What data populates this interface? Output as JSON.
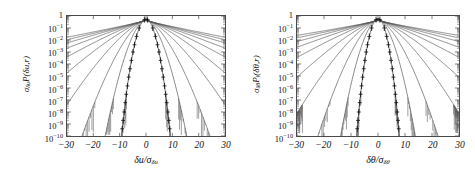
{
  "figure": {
    "background": "#ffffff",
    "axis_color": "#4a4a4a",
    "curve_color": "#555555",
    "marker_color": "#111111",
    "panels": [
      "left",
      "right"
    ]
  },
  "chart_data": [
    {
      "panel": "left",
      "type": "line",
      "title": "",
      "xlabel": "δu/σ_δu",
      "ylabel": "σ_δu P(δu,r)",
      "xlabel_parts": {
        "num": "δu",
        "den_sym": "σ",
        "den_sub": "δu"
      },
      "ylabel_parts": {
        "sigma": "σ",
        "sigma_sub": "δu",
        "p": "P",
        "p_sub": "",
        "arg": "(δu,r)"
      },
      "xlim": [
        -30,
        30
      ],
      "ylim": [
        1e-10,
        1
      ],
      "yscale": "log",
      "xticks": [
        -30,
        -20,
        -10,
        0,
        10,
        20,
        30
      ],
      "xticklabels": [
        "-30",
        "-20",
        "-10",
        "0",
        "10",
        "20",
        "30"
      ],
      "yticks": [
        1,
        0.1,
        0.01,
        0.001,
        0.0001,
        1e-05,
        1e-06,
        1e-07,
        1e-08,
        1e-09,
        1e-10
      ],
      "yticklabels": [
        "1",
        "10⁻¹",
        "10⁻²",
        "10⁻³",
        "10⁻⁴",
        "10⁻⁵",
        "10⁻⁶",
        "10⁻⁷",
        "10⁻⁸",
        "10⁻⁹",
        "10⁻¹⁰"
      ],
      "ytick_mantissa": [
        "1",
        "10",
        "10",
        "10",
        "10",
        "10",
        "10",
        "10",
        "10",
        "10",
        "10"
      ],
      "ytick_exponent": [
        "",
        "-1",
        "-2",
        "-3",
        "-4",
        "-5",
        "-6",
        "-7",
        "-8",
        "-9",
        "-10"
      ],
      "grid": false,
      "legend": "none",
      "series_count": 10,
      "marked_series_index": 0,
      "series": [
        {
          "name": "r1",
          "peak": 0.55,
          "tail_halfwidth": 6.0,
          "shape": 2.0,
          "markers": true
        },
        {
          "name": "r2",
          "peak": 0.5,
          "tail_halfwidth": 8.0,
          "shape": 1.75,
          "markers": false
        },
        {
          "name": "r3",
          "peak": 0.48,
          "tail_halfwidth": 10.0,
          "shape": 1.55,
          "markers": false
        },
        {
          "name": "r4",
          "peak": 0.46,
          "tail_halfwidth": 12.5,
          "shape": 1.4,
          "markers": false
        },
        {
          "name": "r5",
          "peak": 0.45,
          "tail_halfwidth": 15.0,
          "shape": 1.28,
          "markers": false
        },
        {
          "name": "r6",
          "peak": 0.44,
          "tail_halfwidth": 17.5,
          "shape": 1.18,
          "markers": false
        },
        {
          "name": "r7",
          "peak": 0.43,
          "tail_halfwidth": 20.0,
          "shape": 1.1,
          "markers": false
        },
        {
          "name": "r8",
          "peak": 0.42,
          "tail_halfwidth": 22.5,
          "shape": 1.04,
          "markers": false
        },
        {
          "name": "r9",
          "peak": 0.41,
          "tail_halfwidth": 25.0,
          "shape": 1.0,
          "markers": false
        },
        {
          "name": "r10",
          "peak": 0.4,
          "tail_halfwidth": 27.5,
          "shape": 0.96,
          "markers": false
        }
      ],
      "marker_symbol": "+",
      "marker_y_values": [
        0.5,
        0.1,
        0.02,
        0.004,
        0.001,
        0.0002,
        4e-05,
        8e-06,
        1.5e-06,
        3e-07,
        6e-08,
        1e-08,
        2e-09,
        4e-10
      ]
    },
    {
      "panel": "right",
      "type": "line",
      "title": "",
      "xlabel": "δθ/σ_δθ",
      "ylabel": "σ_δθ P_‖(δθ,r)",
      "xlabel_parts": {
        "num": "δθ",
        "den_sym": "σ",
        "den_sub": "δθ"
      },
      "ylabel_parts": {
        "sigma": "σ",
        "sigma_sub": "δθ",
        "p": "P",
        "p_sub": "‖",
        "arg": "(δθ,r)"
      },
      "xlim": [
        -30,
        30
      ],
      "ylim": [
        1e-10,
        1
      ],
      "yscale": "log",
      "xticks": [
        -30,
        -20,
        -10,
        0,
        10,
        20,
        30
      ],
      "xticklabels": [
        "-30",
        "-20",
        "-10",
        "0",
        "10",
        "20",
        "30"
      ],
      "yticks": [
        1,
        0.1,
        0.01,
        0.001,
        0.0001,
        1e-05,
        1e-06,
        1e-07,
        1e-08,
        1e-09,
        1e-10
      ],
      "yticklabels": [
        "1",
        "10⁻¹",
        "10⁻²",
        "10⁻³",
        "10⁻⁴",
        "10⁻⁵",
        "10⁻⁶",
        "10⁻⁷",
        "10⁻⁸",
        "10⁻⁹",
        "10⁻¹⁰"
      ],
      "ytick_mantissa": [
        "1",
        "10",
        "10",
        "10",
        "10",
        "10",
        "10",
        "10",
        "10",
        "10",
        "10"
      ],
      "ytick_exponent": [
        "",
        "-1",
        "-2",
        "-3",
        "-4",
        "-5",
        "-6",
        "-7",
        "-8",
        "-9",
        "-10"
      ],
      "grid": false,
      "legend": "none",
      "series_count": 10,
      "marked_series_index": 0,
      "series": [
        {
          "name": "r1",
          "peak": 0.58,
          "tail_halfwidth": 5.5,
          "shape": 2.1,
          "markers": true
        },
        {
          "name": "r2",
          "peak": 0.52,
          "tail_halfwidth": 7.5,
          "shape": 1.8,
          "markers": false
        },
        {
          "name": "r3",
          "peak": 0.49,
          "tail_halfwidth": 9.5,
          "shape": 1.58,
          "markers": false
        },
        {
          "name": "r4",
          "peak": 0.47,
          "tail_halfwidth": 12.0,
          "shape": 1.42,
          "markers": false
        },
        {
          "name": "r5",
          "peak": 0.46,
          "tail_halfwidth": 14.5,
          "shape": 1.3,
          "markers": false
        },
        {
          "name": "r6",
          "peak": 0.45,
          "tail_halfwidth": 17.5,
          "shape": 1.19,
          "markers": false
        },
        {
          "name": "r7",
          "peak": 0.44,
          "tail_halfwidth": 20.5,
          "shape": 1.1,
          "markers": false
        },
        {
          "name": "r8",
          "peak": 0.43,
          "tail_halfwidth": 23.5,
          "shape": 1.03,
          "markers": false
        },
        {
          "name": "r9",
          "peak": 0.42,
          "tail_halfwidth": 26.5,
          "shape": 0.97,
          "markers": false
        },
        {
          "name": "r10",
          "peak": 0.41,
          "tail_halfwidth": 29.5,
          "shape": 0.92,
          "markers": false
        }
      ],
      "marker_symbol": "+",
      "marker_y_values": [
        0.5,
        0.1,
        0.02,
        0.004,
        0.001,
        0.0002,
        4e-05,
        8e-06,
        1.5e-06,
        3e-07,
        6e-08,
        1e-08,
        2e-09,
        4e-10
      ]
    }
  ]
}
